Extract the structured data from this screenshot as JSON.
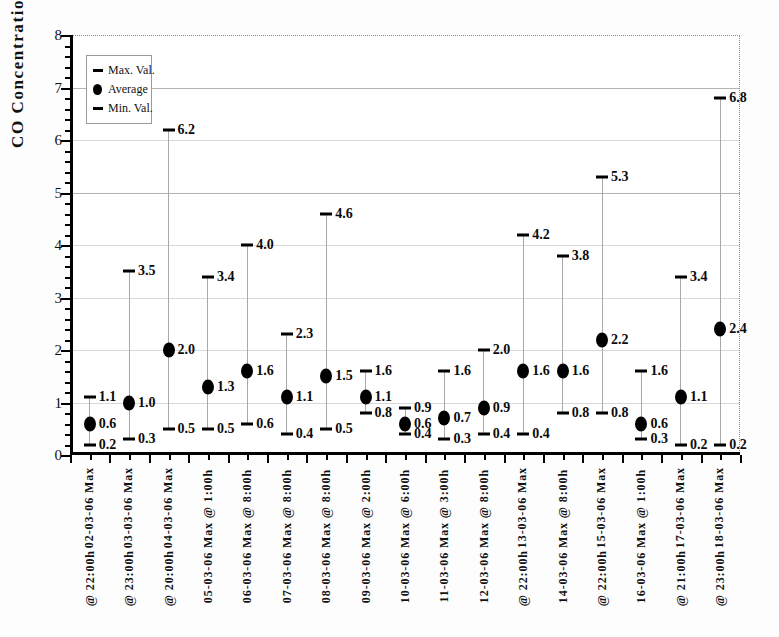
{
  "chart_data": {
    "type": "scatter",
    "title": "",
    "xlabel": "",
    "ylabel": "CO Concentration (ppm)",
    "ylim": [
      0,
      8
    ],
    "ytick_step": 1,
    "yminor_step": 0.2,
    "ytick_labels": [
      "0",
      "1",
      "2",
      "3",
      "4",
      "5",
      "6",
      "7",
      "8"
    ],
    "grid": true,
    "legend_position": "top-left",
    "legend": [
      {
        "mark": "dash",
        "label": "Max. Val."
      },
      {
        "mark": "dot",
        "label": "Average"
      },
      {
        "mark": "dash",
        "label": "Min. Val."
      }
    ],
    "series": [
      {
        "name": "Max. Val.",
        "values": [
          1.1,
          3.5,
          6.2,
          3.4,
          4.0,
          2.3,
          4.6,
          1.6,
          0.9,
          1.6,
          2.0,
          4.2,
          3.8,
          5.3,
          1.6,
          3.4,
          6.8
        ]
      },
      {
        "name": "Average",
        "values": [
          0.6,
          1.0,
          2.0,
          1.3,
          1.6,
          1.1,
          1.5,
          1.1,
          0.6,
          0.7,
          0.9,
          1.6,
          1.6,
          2.2,
          0.6,
          1.1,
          2.4
        ]
      },
      {
        "name": "Min. Val.",
        "values": [
          0.2,
          0.3,
          0.5,
          0.5,
          0.6,
          0.4,
          0.5,
          0.8,
          0.4,
          0.3,
          0.4,
          0.4,
          0.8,
          0.8,
          0.3,
          0.2,
          0.2
        ]
      }
    ],
    "categories": [
      {
        "line1": "02-03-06 Max",
        "line2": "@ 22:00h",
        "offset": "low"
      },
      {
        "line1": "03-03-06 Max",
        "line2": "@ 23:00h",
        "offset": "low"
      },
      {
        "line1": "04-03-06 Max",
        "line2": "@ 20:00h",
        "offset": "low"
      },
      {
        "line1": "05-03-06 Max @ 1:00h",
        "line2": "",
        "offset": "high"
      },
      {
        "line1": "06-03-06 Max @ 8:00h",
        "line2": "",
        "offset": "high"
      },
      {
        "line1": "07-03-06 Max @ 8:00h",
        "line2": "",
        "offset": "high"
      },
      {
        "line1": "08-03-06 Max @ 8:00h",
        "line2": "",
        "offset": "high"
      },
      {
        "line1": "09-03-06 Max @ 2:00h",
        "line2": "",
        "offset": "high"
      },
      {
        "line1": "10-03-06 Max @ 6:00h",
        "line2": "",
        "offset": "high"
      },
      {
        "line1": "11-03-06 Max @ 3:00h",
        "line2": "",
        "offset": "high"
      },
      {
        "line1": "12-03-06 Max @ 8:00h",
        "line2": "",
        "offset": "high"
      },
      {
        "line1": "13-03-06 Max",
        "line2": "@ 22:00h",
        "offset": "low"
      },
      {
        "line1": "14-03-06 Max @ 8:00h",
        "line2": "",
        "offset": "high"
      },
      {
        "line1": "15-03-06 Max",
        "line2": "@ 22:00h",
        "offset": "low"
      },
      {
        "line1": "16-03-06 Max @ 1:00h",
        "line2": "",
        "offset": "high"
      },
      {
        "line1": "17-03-06 Max",
        "line2": "@ 21:00h",
        "offset": "low"
      },
      {
        "line1": "18-03-06 Max",
        "line2": "@ 23:00h",
        "offset": "low"
      }
    ],
    "colors": {
      "marker": "#000000",
      "whisker": "#a8a8a8",
      "grid": "#d8d8d8",
      "axis": "#000000",
      "frame_dotted": "#8a8a8a",
      "background": "#ffffff"
    }
  }
}
